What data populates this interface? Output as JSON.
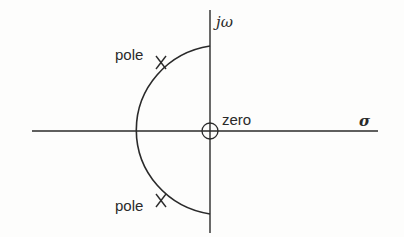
{
  "diagram": {
    "type": "s-plane pole-zero plot",
    "axes": {
      "imaginary_label": "jω",
      "real_label": "σ"
    },
    "labels": {
      "upper_pole": "pole",
      "lower_pole": "pole",
      "zero": "zero"
    },
    "elements": [
      {
        "kind": "pole",
        "marker": "X",
        "position": "upper-left quadrant on semicircle"
      },
      {
        "kind": "pole",
        "marker": "X",
        "position": "lower-left quadrant on semicircle"
      },
      {
        "kind": "zero",
        "marker": "circle",
        "position": "origin"
      }
    ],
    "curve": "left-half-plane semicircle through both poles, centered at origin",
    "colors": {
      "stroke": "#2a2a2a",
      "background": "#fdfdfc"
    }
  }
}
